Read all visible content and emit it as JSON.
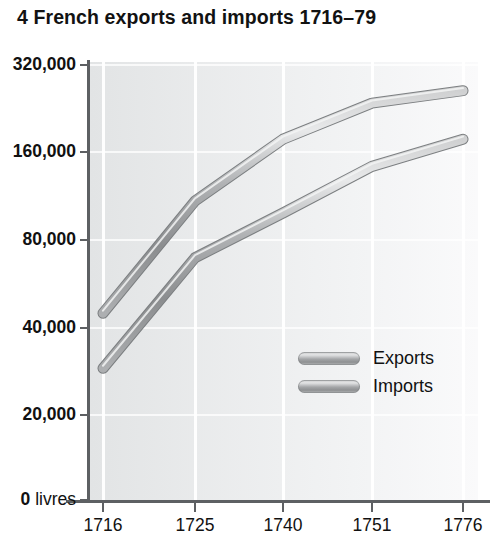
{
  "figure": {
    "title": "4 French exports and imports 1716–79",
    "y_axis_unit_label": "0 livres"
  },
  "legend": {
    "position": "inside-center",
    "entries": [
      {
        "label": "Exports",
        "swatch": "gray-tube-swatch"
      },
      {
        "label": "Imports",
        "swatch": "gray-tube-swatch"
      }
    ]
  },
  "colors": {
    "plot_background": "#ecedee",
    "gridline": "#ffffff",
    "axis": "#5d6063",
    "line_light": "#e3e4e5",
    "line_mid": "#a3a5a7",
    "line_dark": "#76797b",
    "text": "#111111"
  },
  "chart_data": {
    "type": "line",
    "title": "4 French exports and imports 1716–79",
    "xlabel": "",
    "ylabel": "livres",
    "x_scale": "categorical",
    "y_scale": "log",
    "grid": {
      "vertical": true,
      "horizontal": true
    },
    "legend_position": "inside-center",
    "categories": [
      "1716",
      "1725",
      "1740",
      "1751",
      "1776"
    ],
    "xticklabels": [
      "1716",
      "1725",
      "1740",
      "1751",
      "1776"
    ],
    "yticks": [
      0,
      20000,
      40000,
      80000,
      160000,
      320000
    ],
    "yticklabels": [
      "0 livres",
      "20,000",
      "40,000",
      "80,000",
      "160,000",
      "320,000"
    ],
    "ylim": [
      0,
      320000
    ],
    "series": [
      {
        "name": "Exports",
        "values": [
          45000,
          110000,
          180000,
          240000,
          265000
        ]
      },
      {
        "name": "Imports",
        "values": [
          29000,
          70000,
          100000,
          145000,
          180000
        ]
      }
    ]
  }
}
